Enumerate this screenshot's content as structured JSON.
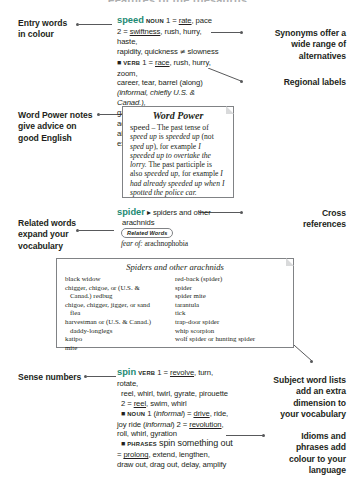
{
  "page": {
    "heading": "Features of the thesaurus"
  },
  "callouts": [
    {
      "id": "entry-words",
      "text": "Entry words\nin colour"
    },
    {
      "id": "word-power",
      "text": "Word Power notes\ngive advice on\ngood English"
    },
    {
      "id": "related-words",
      "text": "Related words\nexpand your\nvocabulary"
    },
    {
      "id": "sense-numbers",
      "text": "Sense numbers"
    },
    {
      "id": "synonyms",
      "text": "Synonyms offer a\nwide range of\nalternatives"
    },
    {
      "id": "regional",
      "text": "Regional labels"
    },
    {
      "id": "cross-refs",
      "text": "Cross\nreferences"
    },
    {
      "id": "subject-lists",
      "text": "Subject word lists\nadd an extra\ndimension to\nyour vocabulary"
    },
    {
      "id": "idioms",
      "text": "Idioms and\nphrases add\ncolour to your\nlanguage"
    }
  ],
  "entries": {
    "speed": {
      "headword": "speed",
      "pos1": "NOUN",
      "lines": [
        "1 = rate, pace",
        "2 = swiftness, rush, hurry, haste,",
        "rapidity, quickness ≠ slowness"
      ],
      "pos2": "VERB",
      "lines2": [
        "1 = race, rush, hurry, zoom,",
        "career, tear, barrel (along)",
        "(informal, chiefly U.S. & Canad.),",
        "gallop ≠ crawl 2 = help, advance,",
        "aid, boost, assist, facilitate,",
        "expedite ≠ hinder"
      ]
    },
    "spider": {
      "headword": "spider",
      "xref": "▸ spiders and other",
      "xref2": "arachnids",
      "related_label": "Related Words",
      "related_text_italic": "fear of:",
      "related_text": " arachnophobia"
    },
    "spin": {
      "headword": "spin",
      "pos1": "VERB",
      "lines": [
        "1 = revolve, turn, rotate,",
        "reel, whirl, twirl, gyrate, pirouette",
        "2 = reel, swim, whirl"
      ],
      "pos2": "NOUN",
      "lines2": [
        "1 (informal) = drive, ride,",
        "joy ride (informal) 2 = revolution,",
        "roll, whirl, gyration"
      ],
      "pos3": "PHRASES",
      "phrase_head": "spin something out",
      "lines3": [
        "= prolong, extend, lengthen,",
        "draw out, drag out, delay, amplify"
      ]
    }
  },
  "word_power": {
    "title": "Word Power",
    "headword": "speed",
    "body": " – The past tense of speed up is speeded up (not sped up), for example I speeded up to overtake the lorry. The past participle is also speeded up, for example I had already speeded up when I spotted the police car."
  },
  "spider_list": {
    "title": "Spiders and other arachnids",
    "left": [
      "black widow",
      "chigger, chigoe, or (U.S. &",
      "Canad.) redbug",
      "chigoe, chigger, jigger, or sand",
      "flea",
      "harvestman or (U.S. & Canad.)",
      "daddy-longlegs",
      "katipo",
      "mite"
    ],
    "left_indent": [
      false,
      false,
      true,
      false,
      true,
      false,
      true,
      false,
      false
    ],
    "right": [
      "red-back (spider)",
      "spider",
      "spider mite",
      "tarantula",
      "tick",
      "trap-door spider",
      "whip scorpion",
      "wolf spider or hunting spider"
    ],
    "right_indent": [
      false,
      false,
      false,
      false,
      false,
      false,
      false,
      false
    ]
  },
  "colors": {
    "headword": "#1c8a73",
    "rule": "#58595b",
    "box_border": "#808285",
    "text": "#231f20"
  }
}
